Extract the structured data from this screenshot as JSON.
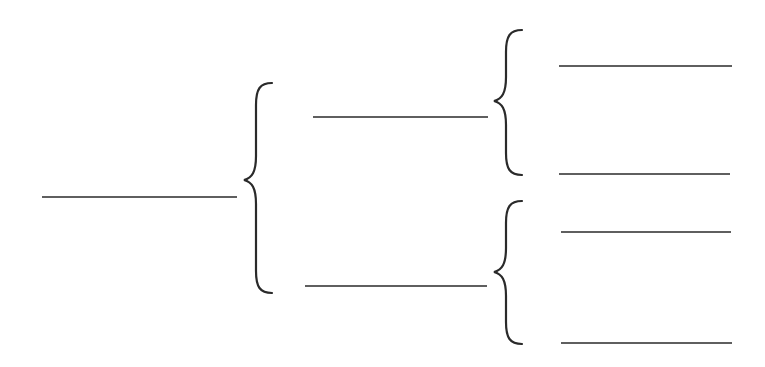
{
  "diagram": {
    "type": "bracket-tree",
    "colors": {
      "background": "#ffffff",
      "stroke": "#2a2a2a"
    },
    "root": {
      "label": "",
      "line": {
        "x1": 42,
        "x2": 237,
        "y": 197
      }
    },
    "braces": [
      {
        "id": "brace-level1",
        "x": 256,
        "top": 83,
        "mid": 180,
        "bottom": 293
      },
      {
        "id": "brace-level2-upper",
        "x": 506,
        "top": 30,
        "mid": 101,
        "bottom": 175
      },
      {
        "id": "brace-level2-lower",
        "x": 506,
        "top": 201,
        "mid": 272,
        "bottom": 344
      }
    ],
    "level2": [
      {
        "label": "",
        "line": {
          "x1": 313,
          "x2": 488,
          "y": 117
        }
      },
      {
        "label": "",
        "line": {
          "x1": 305,
          "x2": 487,
          "y": 286
        }
      }
    ],
    "level3": [
      {
        "label": "",
        "line": {
          "x1": 559,
          "x2": 732,
          "y": 66
        }
      },
      {
        "label": "",
        "line": {
          "x1": 559,
          "x2": 730,
          "y": 174
        }
      },
      {
        "label": "",
        "line": {
          "x1": 561,
          "x2": 731,
          "y": 232
        }
      },
      {
        "label": "",
        "line": {
          "x1": 561,
          "x2": 732,
          "y": 343
        }
      }
    ]
  }
}
